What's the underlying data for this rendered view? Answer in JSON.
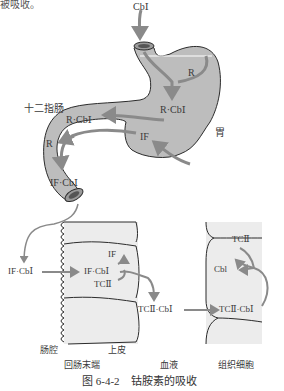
{
  "top_text_fragment": "被吸收。",
  "stomach": {
    "input_label": "CbⅠ",
    "r_label": "R",
    "r_cb_label_stomach": "R·CbⅠ",
    "if_label": "IF",
    "organ_label": "胃"
  },
  "duodenum": {
    "organ_label": "十二指肠",
    "r_cb_label": "R·CbⅠ",
    "r_label": "R",
    "if_cb_label": "IF·CbⅠ"
  },
  "ileum": {
    "lumen_complex": "IF·CbⅠ",
    "cell_complex": "IF·CbⅠ",
    "cell_if": "IF",
    "cell_tc": "TCⅡ",
    "lumen_label": "肠腔",
    "epithelium_label": "上皮",
    "section_label": "回肠末端"
  },
  "blood": {
    "complex": "TCⅡ·CbⅠ",
    "section_label": "血液"
  },
  "tissue": {
    "complex": "TCⅡ·CbⅠ",
    "cbl": "Cbl",
    "tc": "TCⅡ",
    "section_label": "组织细胞"
  },
  "caption": "图 6-4-2　钴胺素的吸收",
  "colors": {
    "organ_fill": "#bdbdbd",
    "organ_stroke": "#2b2b2b",
    "arrow": "#8a8a8a",
    "cell_fill": "#ececec",
    "text": "#3a3a3a"
  }
}
